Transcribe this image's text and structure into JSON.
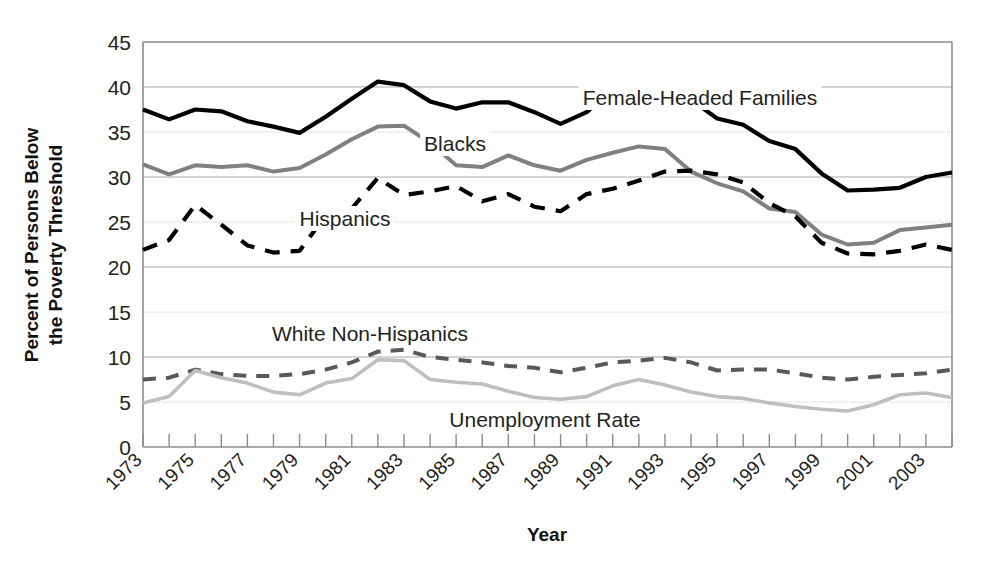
{
  "chart_data": {
    "type": "line",
    "title": "",
    "xlabel": "Year",
    "ylabel": "Percent of Persons Below the Poverty Threshold",
    "ylabel_line1": "Percent of Persons Below",
    "ylabel_line2": "the Poverty Threshold",
    "ylim": [
      0,
      45
    ],
    "ytick_values": [
      0,
      5,
      10,
      15,
      20,
      25,
      30,
      35,
      40,
      45
    ],
    "ytick_labels": [
      "0",
      "5",
      "10",
      "15",
      "20",
      "25",
      "30",
      "35",
      "40",
      "45"
    ],
    "grid": true,
    "legend_position": "inline-annotations",
    "x": [
      1973,
      1974,
      1975,
      1976,
      1977,
      1978,
      1979,
      1980,
      1981,
      1982,
      1983,
      1984,
      1985,
      1986,
      1987,
      1988,
      1989,
      1990,
      1991,
      1992,
      1993,
      1994,
      1995,
      1996,
      1997,
      1998,
      1999,
      2000,
      2001,
      2002,
      2003,
      2004
    ],
    "xtick_labels": [
      "1973",
      "1975",
      "1977",
      "1979",
      "1981",
      "1983",
      "1985",
      "1987",
      "1989",
      "1991",
      "1993",
      "1995",
      "1997",
      "1999",
      "2001",
      "2003"
    ],
    "xlim": [
      1973,
      2004
    ],
    "series": [
      {
        "name": "Female-Headed Families",
        "color": "#000000",
        "style": "solid",
        "width": 4.2,
        "label": "Female-Headed Families",
        "values": [
          37.5,
          36.4,
          37.5,
          37.3,
          36.2,
          35.6,
          34.9,
          36.7,
          38.7,
          40.6,
          40.2,
          38.4,
          37.6,
          38.3,
          38.3,
          37.2,
          35.9,
          37.2,
          39.7,
          39.0,
          38.7,
          38.6,
          36.5,
          35.8,
          34.0,
          33.1,
          30.4,
          28.5,
          28.6,
          28.8,
          30.0,
          30.5
        ]
      },
      {
        "name": "Blacks",
        "color": "#808080",
        "style": "solid",
        "width": 4.0,
        "label": "Blacks",
        "values": [
          31.4,
          30.3,
          31.3,
          31.1,
          31.3,
          30.6,
          31.0,
          32.5,
          34.2,
          35.6,
          35.7,
          33.8,
          31.3,
          31.1,
          32.4,
          31.3,
          30.7,
          31.9,
          32.7,
          33.4,
          33.1,
          30.6,
          29.3,
          28.4,
          26.5,
          26.1,
          23.6,
          22.5,
          22.7,
          24.1,
          24.4,
          24.7
        ]
      },
      {
        "name": "Hispanics",
        "color": "#000000",
        "style": "dashed",
        "width": 4.2,
        "label": "Hispanics",
        "values": [
          21.9,
          23.0,
          26.9,
          24.7,
          22.4,
          21.6,
          21.8,
          25.7,
          26.5,
          29.9,
          28.0,
          28.4,
          29.0,
          27.3,
          28.1,
          26.7,
          26.2,
          28.1,
          28.7,
          29.6,
          30.6,
          30.7,
          30.3,
          29.4,
          27.1,
          25.6,
          22.7,
          21.5,
          21.4,
          21.8,
          22.5,
          21.9
        ]
      },
      {
        "name": "White Non-Hispanics",
        "color": "#595959",
        "style": "dashed",
        "width": 4.0,
        "label": "White Non-Hispanics",
        "values": [
          7.5,
          7.7,
          8.6,
          8.1,
          7.9,
          7.9,
          8.1,
          8.6,
          9.4,
          10.6,
          10.8,
          10.0,
          9.7,
          9.4,
          9.0,
          8.8,
          8.3,
          8.8,
          9.4,
          9.6,
          9.9,
          9.4,
          8.5,
          8.6,
          8.6,
          8.2,
          7.7,
          7.5,
          7.8,
          8.0,
          8.2,
          8.6
        ]
      },
      {
        "name": "Unemployment Rate",
        "color": "#bfbfbf",
        "style": "solid",
        "width": 3.6,
        "label": "Unemployment Rate",
        "values": [
          4.9,
          5.6,
          8.5,
          7.7,
          7.1,
          6.1,
          5.8,
          7.1,
          7.6,
          9.7,
          9.6,
          7.5,
          7.2,
          7.0,
          6.2,
          5.5,
          5.3,
          5.6,
          6.8,
          7.5,
          6.9,
          6.1,
          5.6,
          5.4,
          4.9,
          4.5,
          4.2,
          4.0,
          4.7,
          5.8,
          6.0,
          5.5
        ]
      }
    ],
    "annotations": [
      {
        "text": "Female-Headed Families",
        "x_px": 700,
        "y_px": 105
      },
      {
        "text": "Blacks",
        "x_px": 455,
        "y_px": 151
      },
      {
        "text": "Hispanics",
        "x_px": 345,
        "y_px": 226
      },
      {
        "text": "White Non-Hispanics",
        "x_px": 370,
        "y_px": 341
      },
      {
        "text": "Unemployment Rate",
        "x_px": 545,
        "y_px": 427
      }
    ]
  }
}
